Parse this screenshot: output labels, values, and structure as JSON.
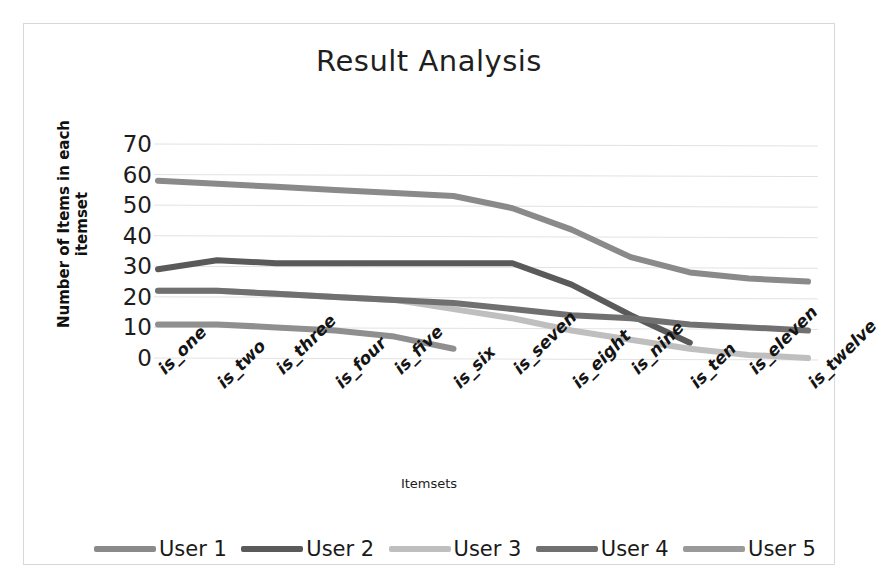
{
  "chart_data": {
    "type": "line",
    "title": "Result  Analysis",
    "xlabel": "Itemsets",
    "ylabel": "Number of Items in each  itemset",
    "categories": [
      "is_one",
      "is_two",
      "is_three",
      "is_four",
      "is_five",
      "is_six",
      "is_seven",
      "is_eight",
      "is_nine",
      "is_ten",
      "is_eleven",
      "is_twelve"
    ],
    "ylim": [
      0,
      70
    ],
    "yticks": [
      70,
      60,
      50,
      40,
      30,
      20,
      10,
      0
    ],
    "grid": true,
    "legend_position": "bottom",
    "series": [
      {
        "name": "User 1",
        "color": "#8a8a8a",
        "values": [
          58,
          57,
          56,
          55,
          54,
          53,
          49,
          42,
          33,
          28,
          26,
          25
        ]
      },
      {
        "name": "User 2",
        "color": "#5a5a5a",
        "values": [
          29,
          32,
          31,
          31,
          31,
          31,
          31,
          24,
          14,
          5,
          null,
          null
        ]
      },
      {
        "name": "User 3",
        "color": "#bfbfbf",
        "values": [
          22,
          22,
          21,
          20,
          19,
          16,
          13,
          9,
          6,
          3,
          1,
          0
        ]
      },
      {
        "name": "User 4",
        "color": "#707070",
        "values": [
          22,
          22,
          21,
          20,
          19,
          18,
          16,
          14,
          13,
          11,
          10,
          9
        ]
      },
      {
        "name": "User 5",
        "color": "#8f8f8f",
        "values": [
          11,
          11,
          10,
          9,
          7,
          3,
          null,
          null,
          null,
          null,
          null,
          null
        ]
      }
    ]
  },
  "legend": {
    "items": [
      {
        "label": "User 1",
        "color": "#8a8a8a"
      },
      {
        "label": "User 2",
        "color": "#5a5a5a"
      },
      {
        "label": "User 3",
        "color": "#bfbfbf"
      },
      {
        "label": "User 4",
        "color": "#707070"
      },
      {
        "label": "User 5",
        "color": "#9a9a9a"
      }
    ]
  }
}
